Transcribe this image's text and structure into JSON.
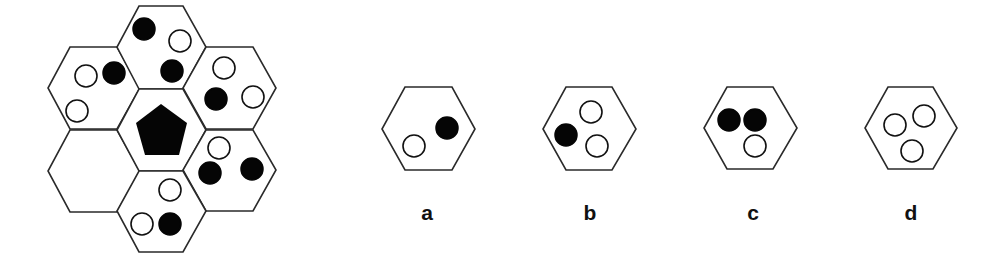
{
  "puzzle": {
    "description": "Hexagon honeycomb figure puzzle with one empty cell; choose the missing cell",
    "center": {
      "shape": "pentagon",
      "fill": "black"
    },
    "cells": [
      {
        "position": "top",
        "dots": [
          "black",
          "white",
          "black"
        ]
      },
      {
        "position": "upper-right",
        "dots": [
          "white",
          "black",
          "white"
        ]
      },
      {
        "position": "lower-right",
        "dots": [
          "white",
          "black",
          "black"
        ]
      },
      {
        "position": "bottom",
        "dots": [
          "white",
          "white",
          "black"
        ]
      },
      {
        "position": "lower-left",
        "dots": [],
        "missing": true
      },
      {
        "position": "upper-left",
        "dots": [
          "white",
          "black",
          "white"
        ]
      }
    ]
  },
  "options": [
    {
      "label": "a",
      "dots": [
        "white",
        "black"
      ]
    },
    {
      "label": "b",
      "dots": [
        "white",
        "black",
        "white"
      ]
    },
    {
      "label": "c",
      "dots": [
        "black",
        "black",
        "white"
      ]
    },
    {
      "label": "d",
      "dots": [
        "white",
        "white",
        "white"
      ]
    }
  ],
  "colors": {
    "stroke": "#2a2a2a",
    "black": "#050505",
    "white": "#ffffff"
  }
}
